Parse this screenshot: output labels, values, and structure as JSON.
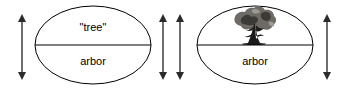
{
  "diagram": {
    "type": "semiotic-sign-diagram",
    "background_color": "#ffffff",
    "stroke_color": "#000000",
    "arrow_color": "#2b2b2b",
    "signs": [
      {
        "id": "sign-left",
        "upper_label": "\"tree\"",
        "lower_label": "arbor",
        "upper_is_image": false,
        "center_x": 93,
        "center_y": 45,
        "radius_x": 58,
        "radius_y": 39
      },
      {
        "id": "sign-right",
        "upper_label": "",
        "lower_label": "arbor",
        "upper_is_image": true,
        "upper_image_name": "tree-illustration",
        "center_x": 255,
        "center_y": 45,
        "radius_x": 58,
        "radius_y": 39
      }
    ],
    "arrows": [
      {
        "id": "arrow-far-left",
        "name": "vertical-double-arrow",
        "x": 22,
        "y_top": 16,
        "y_bottom": 78
      },
      {
        "id": "arrow-mid-left",
        "name": "vertical-double-arrow",
        "x": 163,
        "y_top": 16,
        "y_bottom": 78
      },
      {
        "id": "arrow-mid-right",
        "name": "vertical-double-arrow",
        "x": 180,
        "y_top": 16,
        "y_bottom": 78
      },
      {
        "id": "arrow-far-right",
        "name": "vertical-double-arrow",
        "x": 327,
        "y_top": 16,
        "y_bottom": 78
      }
    ]
  }
}
